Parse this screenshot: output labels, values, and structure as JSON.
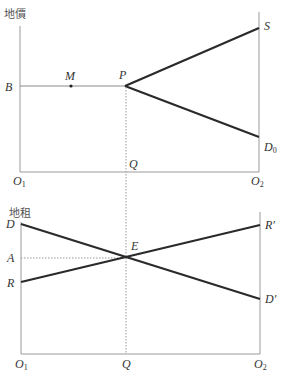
{
  "top_panel": {
    "y_axis_title": "地價",
    "labels": {
      "B": "B",
      "M": "M",
      "P": "P",
      "S": "S",
      "D0_main": "D",
      "D0_sub": "0",
      "Q": "Q",
      "O1_main": "O",
      "O1_sub": "1",
      "O2_main": "O",
      "O2_sub": "2"
    }
  },
  "bottom_panel": {
    "y_axis_title": "地租",
    "labels": {
      "D": "D",
      "A": "A",
      "R": "R",
      "E": "E",
      "R_prime": "R′",
      "D_prime": "D′",
      "Q": "Q",
      "O1_main": "O",
      "O1_sub": "1",
      "O2_main": "O",
      "O2_sub": "2"
    }
  },
  "colors": {
    "thick_line": "#2a2a2a",
    "axis": "#9a9a9a",
    "text": "#333333"
  }
}
